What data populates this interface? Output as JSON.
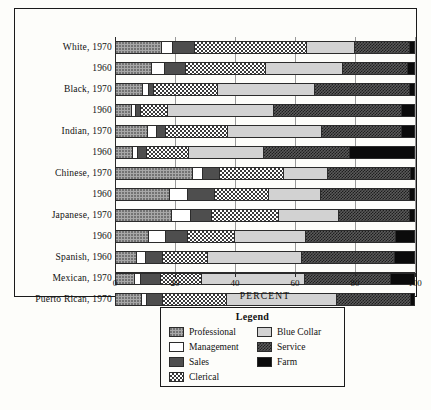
{
  "chart_data": {
    "type": "bar",
    "orientation": "horizontal",
    "stacked": true,
    "title": "",
    "xlabel": "PERCENT",
    "ylabel": "",
    "xlim": [
      0,
      100
    ],
    "xticks": [
      0,
      20,
      40,
      60,
      80,
      100
    ],
    "grid": true,
    "legend_position": "bottom",
    "legend_title": "Legend",
    "categories": [
      "White, 1970",
      "1960",
      "Black, 1970",
      "1960",
      "Indian, 1970",
      "1960",
      "Chinese, 1970",
      "1960",
      "Japanese, 1970",
      "1960",
      "Spanish, 1960",
      "Mexican, 1970",
      "Puerto Rican, 1970"
    ],
    "series": [
      {
        "name": "Professional",
        "pattern": "gray-dots",
        "values": [
          15.5,
          12.0,
          9.0,
          5.0,
          10.5,
          5.5,
          26.0,
          18.0,
          19.0,
          11.0,
          7.0,
          6.0,
          8.5
        ]
      },
      {
        "name": "Management",
        "pattern": "white",
        "values": [
          3.5,
          4.0,
          1.5,
          1.0,
          3.0,
          1.5,
          3.0,
          6.0,
          6.0,
          5.5,
          2.5,
          2.0,
          1.5
        ]
      },
      {
        "name": "Sales",
        "pattern": "dark-gray",
        "values": [
          7.0,
          7.0,
          1.5,
          1.5,
          2.5,
          2.5,
          5.5,
          9.0,
          7.0,
          7.0,
          5.5,
          6.5,
          5.0
        ]
      },
      {
        "name": "Clerical",
        "pattern": "checkerboard",
        "values": [
          38.0,
          27.0,
          21.5,
          9.0,
          21.0,
          14.0,
          21.5,
          18.0,
          22.5,
          16.0,
          15.0,
          13.5,
          21.5
        ]
      },
      {
        "name": "Blue Collar",
        "pattern": "light-gray",
        "values": [
          16.0,
          26.0,
          33.0,
          36.0,
          32.0,
          25.5,
          15.0,
          17.5,
          20.0,
          24.0,
          32.0,
          35.0,
          37.5
        ]
      },
      {
        "name": "Service",
        "pattern": "dark-check",
        "values": [
          18.5,
          22.0,
          32.0,
          43.5,
          27.0,
          29.0,
          28.0,
          30.0,
          24.0,
          30.5,
          31.5,
          29.0,
          25.0
        ]
      },
      {
        "name": "Farm",
        "pattern": "black",
        "values": [
          1.5,
          2.0,
          1.5,
          4.0,
          4.0,
          22.0,
          1.0,
          1.5,
          1.5,
          6.0,
          6.5,
          8.0,
          1.0
        ]
      }
    ]
  },
  "axis": {
    "title": "PERCENT",
    "ticks": [
      "0",
      "20",
      "40",
      "60",
      "80",
      "100"
    ]
  },
  "legend": {
    "title": "Legend",
    "items": [
      {
        "label": "Professional",
        "pattern": "p-professional"
      },
      {
        "label": "Blue Collar",
        "pattern": "p-bluecollar"
      },
      {
        "label": "Management",
        "pattern": "p-management"
      },
      {
        "label": "Service",
        "pattern": "p-service"
      },
      {
        "label": "Sales",
        "pattern": "p-sales"
      },
      {
        "label": "Farm",
        "pattern": "p-farm"
      },
      {
        "label": "Clerical",
        "pattern": "p-clerical"
      }
    ]
  }
}
